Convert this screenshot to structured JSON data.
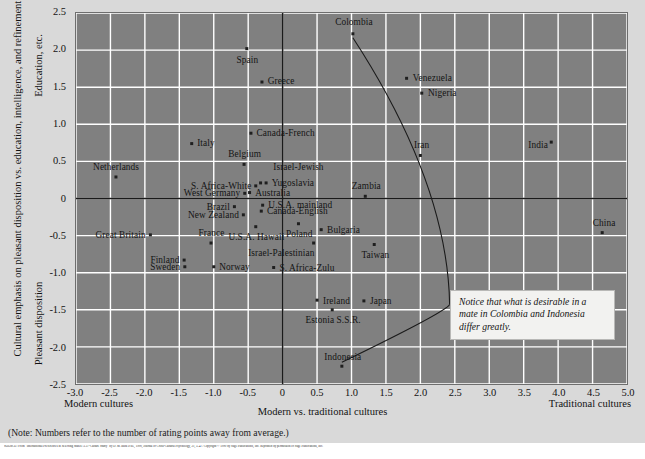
{
  "chart_data": {
    "type": "scatter",
    "title": "",
    "xlabel": "Modern vs. traditional cultures",
    "ylabel": "Cultural emphasis on pleasant disposition vs. education, intelligence, and refinement",
    "ylabel_top": "Education, etc.",
    "ylabel_bottom": "Pleasant disposition",
    "xlabel_left": "Modern cultures",
    "xlabel_right": "Traditional cultures",
    "xlim": [
      -3.0,
      5.0
    ],
    "ylim": [
      -2.5,
      2.5
    ],
    "xticks": [
      "-3.0",
      "-2.5",
      "-2.0",
      "-1.5",
      "-1.0",
      "-0.5",
      "0",
      "0.5",
      "1.0",
      "1.5",
      "2.0",
      "2.5",
      "3.0",
      "3.5",
      "4.0",
      "4.5",
      "5.0"
    ],
    "xtick_values": [
      -3.0,
      -2.5,
      -2.0,
      -1.5,
      -1.0,
      -0.5,
      0,
      0.5,
      1.0,
      1.5,
      2.0,
      2.5,
      3.0,
      3.5,
      4.0,
      4.5,
      5.0
    ],
    "yticks": [
      "2.5",
      "2.0",
      "1.5",
      "1.0",
      "0.5",
      "0",
      "-0.5",
      "-1.0",
      "-1.5",
      "-2.0",
      "-2.5"
    ],
    "ytick_values": [
      2.5,
      2.0,
      1.5,
      1.0,
      0.5,
      0,
      -0.5,
      -1.0,
      -1.5,
      -2.0,
      -2.5
    ],
    "grid": true,
    "grid_color": "#ffffff",
    "plot_bg": "#808080",
    "page_bg": "#d9d9d9",
    "axis_color": "#1a1a1a",
    "point_color": "#1f1f1f",
    "points": [
      {
        "label": "Spain",
        "x": -0.52,
        "y": 2.02,
        "pos": "c",
        "dx": 0,
        "dy": 12
      },
      {
        "label": "Greece",
        "x": -0.3,
        "y": 1.57,
        "pos": "l",
        "dx": 5,
        "dy": 0
      },
      {
        "label": "Colombia",
        "x": 1.02,
        "y": 2.22,
        "pos": "c",
        "dx": 0,
        "dy": -11
      },
      {
        "label": "Venezuela",
        "x": 1.8,
        "y": 1.62,
        "pos": "l",
        "dx": 5,
        "dy": 0
      },
      {
        "label": "Nigeria",
        "x": 2.02,
        "y": 1.42,
        "pos": "l",
        "dx": 5,
        "dy": 0
      },
      {
        "label": "Canada-French",
        "x": -0.46,
        "y": 0.88,
        "pos": "l",
        "dx": 5,
        "dy": 0
      },
      {
        "label": "Italy",
        "x": -1.32,
        "y": 0.74,
        "pos": "l",
        "dx": 5,
        "dy": 0
      },
      {
        "label": "India",
        "x": 3.9,
        "y": 0.76,
        "pos": "r",
        "dx": -5,
        "dy": 3
      },
      {
        "label": "Iran",
        "x": 2.0,
        "y": 0.58,
        "pos": "c",
        "dx": 0,
        "dy": -10
      },
      {
        "label": "Belgium",
        "x": -0.56,
        "y": 0.46,
        "pos": "c",
        "dx": 0,
        "dy": -10
      },
      {
        "label": "Netherlands",
        "x": -2.42,
        "y": 0.29,
        "pos": "c",
        "dx": 0,
        "dy": -10
      },
      {
        "label": "Israel-Jewish",
        "x": -0.32,
        "y": 0.21,
        "pos": "l",
        "dx": 12,
        "dy": -16
      },
      {
        "label": "Yugoslavia",
        "x": -0.24,
        "y": 0.21,
        "pos": "l",
        "dx": 5,
        "dy": 0
      },
      {
        "label": "S. Africa-White",
        "x": -0.39,
        "y": 0.17,
        "pos": "r",
        "dx": -5,
        "dy": 0
      },
      {
        "label": "Australia",
        "x": -0.48,
        "y": 0.08,
        "pos": "l",
        "dx": 5,
        "dy": 0
      },
      {
        "label": "West Germany",
        "x": -0.55,
        "y": 0.07,
        "pos": "r",
        "dx": -5,
        "dy": 0
      },
      {
        "label": "Zambia",
        "x": 1.2,
        "y": 0.03,
        "pos": "c",
        "dx": 0,
        "dy": -10
      },
      {
        "label": "U.S.A. mainland",
        "x": -0.29,
        "y": -0.09,
        "pos": "l",
        "dx": 5,
        "dy": 0
      },
      {
        "label": "Brazil",
        "x": -0.7,
        "y": -0.11,
        "pos": "r",
        "dx": -5,
        "dy": 0
      },
      {
        "label": "Canada-English",
        "x": -0.31,
        "y": -0.17,
        "pos": "l",
        "dx": 5,
        "dy": 0
      },
      {
        "label": "New Zealand",
        "x": -0.57,
        "y": -0.22,
        "pos": "r",
        "dx": -5,
        "dy": 0
      },
      {
        "label": "Poland",
        "x": 0.23,
        "y": -0.34,
        "pos": "c",
        "dx": 0,
        "dy": 10
      },
      {
        "label": "Bulgaria",
        "x": 0.56,
        "y": -0.42,
        "pos": "l",
        "dx": 5,
        "dy": 0
      },
      {
        "label": "China",
        "x": 4.64,
        "y": -0.46,
        "pos": "c",
        "dx": 0,
        "dy": -10
      },
      {
        "label": "Great Britain",
        "x": -1.92,
        "y": -0.49,
        "pos": "r",
        "dx": -5,
        "dy": 0
      },
      {
        "label": "U.S.A. Hawaii",
        "x": -0.39,
        "y": -0.38,
        "pos": "c",
        "dx": 0,
        "dy": 10
      },
      {
        "label": "France",
        "x": -1.04,
        "y": -0.6,
        "pos": "c",
        "dx": 0,
        "dy": -10
      },
      {
        "label": "Israel-Palestinian",
        "x": 0.45,
        "y": -0.6,
        "pos": "r",
        "dx": 0,
        "dy": 10
      },
      {
        "label": "Taiwan",
        "x": 1.33,
        "y": -0.62,
        "pos": "c",
        "dx": 0,
        "dy": 10
      },
      {
        "label": "Finland",
        "x": -1.43,
        "y": -0.83,
        "pos": "r",
        "dx": -5,
        "dy": 0
      },
      {
        "label": "Sweden",
        "x": -1.42,
        "y": -0.92,
        "pos": "r",
        "dx": -5,
        "dy": 0
      },
      {
        "label": "Norway",
        "x": -1.0,
        "y": -0.92,
        "pos": "l",
        "dx": 5,
        "dy": 0
      },
      {
        "label": "S. Africa-Zulu",
        "x": -0.13,
        "y": -0.93,
        "pos": "l",
        "dx": 5,
        "dy": 0
      },
      {
        "label": "Ireland",
        "x": 0.5,
        "y": -1.37,
        "pos": "l",
        "dx": 5,
        "dy": 0
      },
      {
        "label": "Japan",
        "x": 1.18,
        "y": -1.38,
        "pos": "l",
        "dx": 5,
        "dy": 0
      },
      {
        "label": "Estonia S.S.R.",
        "x": 0.72,
        "y": -1.5,
        "pos": "c",
        "dx": 0,
        "dy": 10
      },
      {
        "label": "Indonesia",
        "x": 0.86,
        "y": -2.26,
        "pos": "c",
        "dx": 0,
        "dy": -10
      }
    ],
    "annotation": {
      "text": "Notice that what is desirable in a mate in Colombia and Indonesia differ greatly.",
      "targets": [
        "Colombia",
        "Indonesia"
      ]
    }
  },
  "footer": {
    "note": "(Note: Numbers refer to the number of rating points away from average.)",
    "source": "SOURCE: From “International Preferences in Selecting Mates: A 37-Culture Study” by D. M. Buss et al., 1990, Journal of Cross-Cultural Psychology, 21, 5–47. Copyright © 1990 by Sage Publications, Inc. Reprinted by permission of Sage Publications, Inc."
  }
}
